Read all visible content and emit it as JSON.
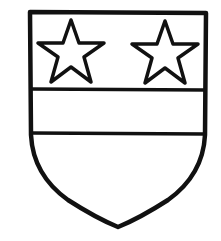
{
  "figure": {
    "description": "Heraldic shield: two five-pointed stars in chief, a horizontal fess band below",
    "colors": {
      "background": "#ffffff",
      "line": "#111111",
      "fill": "#ffffff"
    },
    "charges": [
      {
        "type": "mullet",
        "name": "star-left"
      },
      {
        "type": "mullet",
        "name": "star-right"
      }
    ],
    "ordinary": "fess"
  }
}
